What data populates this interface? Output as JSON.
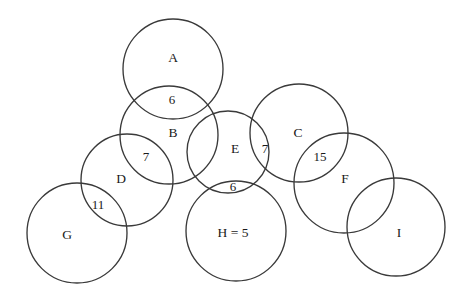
{
  "diagram": {
    "type": "venn-chain",
    "background_color": "#ffffff",
    "stroke_color": "#3a3a3a",
    "text_color": "#1a1a1a",
    "circles": [
      {
        "id": "A",
        "label": "A",
        "cx": 173,
        "cy": 69,
        "r": 50,
        "label_x": 173,
        "label_y": 59
      },
      {
        "id": "B",
        "label": "B",
        "cx": 169,
        "cy": 135,
        "r": 49,
        "label_x": 173,
        "label_y": 134
      },
      {
        "id": "C",
        "label": "C",
        "cx": 299,
        "cy": 133,
        "r": 49,
        "label_x": 298,
        "label_y": 134
      },
      {
        "id": "D",
        "label": "D",
        "cx": 127,
        "cy": 180,
        "r": 46,
        "label_x": 121,
        "label_y": 180
      },
      {
        "id": "E",
        "label": "E",
        "cx": 228,
        "cy": 152,
        "r": 41,
        "label_x": 235,
        "label_y": 150
      },
      {
        "id": "F",
        "label": "F",
        "cx": 344,
        "cy": 183,
        "r": 50,
        "label_x": 345,
        "label_y": 180
      },
      {
        "id": "G",
        "label": "G",
        "cx": 77,
        "cy": 233,
        "r": 50,
        "label_x": 67,
        "label_y": 236
      },
      {
        "id": "H",
        "label": "H = 5",
        "cx": 236,
        "cy": 231,
        "r": 50,
        "label_x": 233,
        "label_y": 234
      },
      {
        "id": "I",
        "label": "I",
        "cx": 396,
        "cy": 227,
        "r": 49,
        "label_x": 399,
        "label_y": 234
      }
    ],
    "intersection_values": [
      {
        "id": "A-B",
        "between": [
          "A",
          "B"
        ],
        "value": "6",
        "x": 172,
        "y": 101
      },
      {
        "id": "B-D",
        "between": [
          "B",
          "D"
        ],
        "value": "7",
        "x": 146,
        "y": 158
      },
      {
        "id": "D-G",
        "between": [
          "D",
          "G"
        ],
        "value": "11",
        "x": 98,
        "y": 206
      },
      {
        "id": "E-C",
        "between": [
          "E",
          "C"
        ],
        "value": "7",
        "x": 265,
        "y": 150
      },
      {
        "id": "C-F",
        "between": [
          "C",
          "F"
        ],
        "value": "15",
        "x": 320,
        "y": 158
      },
      {
        "id": "E-H",
        "between": [
          "E",
          "H"
        ],
        "value": "6",
        "x": 233,
        "y": 188
      }
    ]
  }
}
